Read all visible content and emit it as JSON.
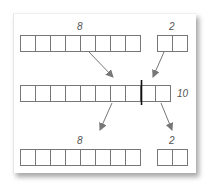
{
  "diagram": {
    "top_row": {
      "groups": [
        {
          "label": "8",
          "cells": 8
        },
        {
          "label": "2",
          "cells": 2
        }
      ]
    },
    "middle_row": {
      "label": "10",
      "cells": 10,
      "divider_after_cell": 8
    },
    "bottom_row": {
      "groups": [
        {
          "label": "8",
          "cells": 8
        },
        {
          "label": "2",
          "cells": 2
        }
      ]
    },
    "colors": {
      "cell_border": "#777777",
      "arrow": "#777777",
      "divider": "#111111",
      "label": "#555555"
    }
  }
}
